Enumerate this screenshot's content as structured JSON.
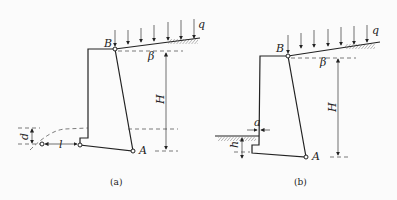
{
  "figure": {
    "panels": [
      {
        "id": "a",
        "caption": "(a)",
        "labels": {
          "B": "B",
          "A": "A",
          "beta": "β",
          "H": "H",
          "q": "q",
          "d": "d",
          "l": "l"
        }
      },
      {
        "id": "b",
        "caption": "(b)",
        "labels": {
          "B": "B",
          "A": "A",
          "beta": "β",
          "H": "H",
          "q": "q",
          "a": "a",
          "h": "h"
        }
      }
    ],
    "colors": {
      "line": "#222222",
      "background": "#fbfbfb"
    }
  }
}
